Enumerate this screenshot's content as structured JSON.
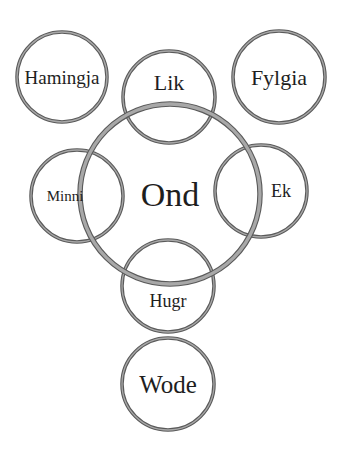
{
  "diagram": {
    "type": "venn-like concept map",
    "stroke_colors": {
      "outer": "#5a5a5a",
      "inner": "#a8a8a8"
    },
    "text_color": "#1e1e1e",
    "background": "#ffffff",
    "center_node": "Ond",
    "nodes": [
      {
        "id": "hamingja",
        "label": "Hamingja",
        "cx": 62,
        "cy": 77,
        "r": 45,
        "font_size": 19,
        "stroke_width": 3.5,
        "overlaps": []
      },
      {
        "id": "lik",
        "label": "Lik",
        "cx": 169,
        "cy": 97,
        "r": 46,
        "font_size": 22,
        "stroke_width": 3.5,
        "overlaps": [
          "ond"
        ]
      },
      {
        "id": "fylgia",
        "label": "Fylgia",
        "cx": 279,
        "cy": 77,
        "r": 46,
        "font_size": 22,
        "stroke_width": 3.5,
        "overlaps": []
      },
      {
        "id": "minni",
        "label": "Minni",
        "cx": 77,
        "cy": 196,
        "r": 46,
        "font_size": 15,
        "stroke_width": 3.5,
        "overlaps": [
          "ond"
        ]
      },
      {
        "id": "ond",
        "label": "Ond",
        "cx": 170,
        "cy": 194,
        "r": 90,
        "font_size": 34,
        "stroke_width": 5.5,
        "overlaps": [
          "lik",
          "minni",
          "ek",
          "hugr"
        ]
      },
      {
        "id": "ek",
        "label": "Ek",
        "cx": 261,
        "cy": 191,
        "r": 46,
        "font_size": 18,
        "stroke_width": 3.5,
        "overlaps": [
          "ond"
        ]
      },
      {
        "id": "hugr",
        "label": "Hugr",
        "cx": 168,
        "cy": 286,
        "r": 46,
        "font_size": 18,
        "stroke_width": 3.5,
        "overlaps": [
          "ond"
        ]
      },
      {
        "id": "wode",
        "label": "Wode",
        "cx": 168,
        "cy": 384,
        "r": 46,
        "font_size": 25,
        "stroke_width": 3.5,
        "overlaps": []
      }
    ],
    "label_offsets": {
      "hamingja": [
        0,
        0
      ],
      "lik": [
        0,
        -15
      ],
      "fylgia": [
        0,
        0
      ],
      "minni": [
        -12,
        0
      ],
      "ond": [
        0,
        0
      ],
      "ek": [
        20,
        0
      ],
      "hugr": [
        0,
        15
      ],
      "wode": [
        0,
        0
      ]
    }
  }
}
